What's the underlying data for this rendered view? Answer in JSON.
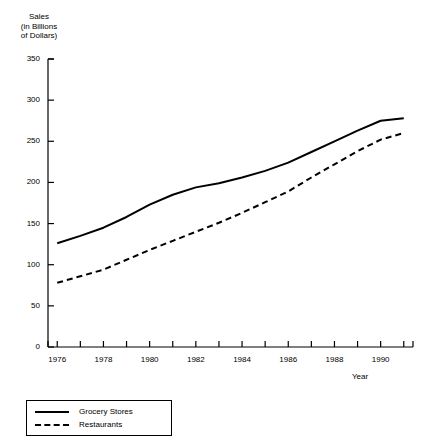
{
  "chart_data": {
    "type": "line",
    "title": "",
    "xlabel": "Year",
    "ylabel": "Sales\n(in Billions\nof Dollars)",
    "x": [
      1976,
      1977,
      1978,
      1979,
      1980,
      1981,
      1982,
      1983,
      1984,
      1985,
      1986,
      1987,
      1988,
      1989,
      1990,
      1991
    ],
    "xtick_labels": [
      "1976",
      "1978",
      "1980",
      "1982",
      "1984",
      "1986",
      "1988",
      "1990"
    ],
    "xtick_values": [
      1976,
      1978,
      1980,
      1982,
      1984,
      1986,
      1988,
      1990
    ],
    "ytick_labels": [
      "0",
      "50",
      "100",
      "150",
      "200",
      "250",
      "300",
      "350"
    ],
    "ytick_values": [
      0,
      50,
      100,
      150,
      200,
      250,
      300,
      350
    ],
    "xlim": [
      1975.6,
      1991.4
    ],
    "ylim": [
      0,
      350
    ],
    "grid": false,
    "legend_position": "below-left",
    "series": [
      {
        "name": "Grocery Stores",
        "style": "solid",
        "color": "#000000",
        "values": [
          126,
          135,
          145,
          158,
          173,
          185,
          194,
          199,
          206,
          214,
          224,
          237,
          250,
          263,
          275,
          278
        ]
      },
      {
        "name": "Restaurants",
        "style": "dashed",
        "color": "#000000",
        "values": [
          78,
          86,
          94,
          106,
          118,
          129,
          140,
          151,
          163,
          176,
          189,
          206,
          222,
          238,
          252,
          260
        ]
      }
    ]
  },
  "legend": {
    "items": [
      {
        "label": "Grocery Stores",
        "style": "solid"
      },
      {
        "label": "Restaurants",
        "style": "dashed"
      }
    ]
  }
}
